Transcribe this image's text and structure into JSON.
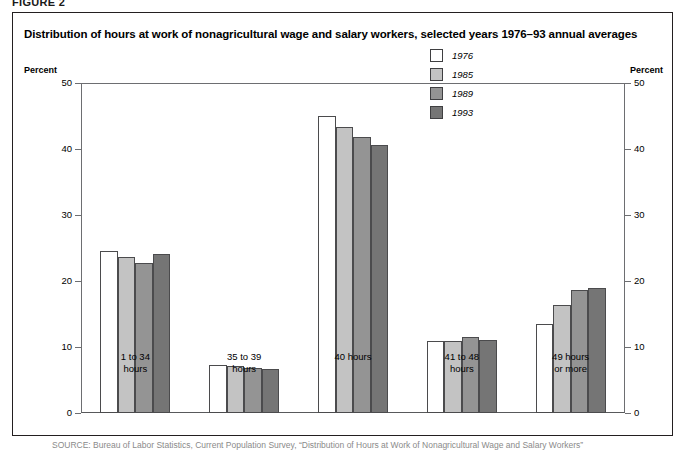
{
  "figure": {
    "number_label": "FIGURE 2",
    "title": "Distribution of hours at work of nonagricultural wage and salary workers, selected years 1976–93 annual averages",
    "source_note": "SOURCE: Bureau of Labor Statistics, Current Population Survey, “Distribution of Hours at Work of Nonagricultural Wage and Salary Workers”"
  },
  "axis": {
    "left_title": "Percent",
    "right_title": "Percent",
    "ticks": [
      "50",
      "40",
      "30",
      "20",
      "10",
      "0"
    ]
  },
  "legend": {
    "items": [
      {
        "label": "1976",
        "color": "#ffffff"
      },
      {
        "label": "1985",
        "color": "#c3c3c3"
      },
      {
        "label": "1989",
        "color": "#949494"
      },
      {
        "label": "1993",
        "color": "#757575"
      }
    ]
  },
  "chart_data": {
    "type": "bar",
    "title": "Distribution of hours at work of nonagricultural wage and salary workers, selected years 1976–93 annual averages",
    "xlabel": "",
    "ylabel": "Percent",
    "ylim": [
      0,
      50
    ],
    "yticks": [
      0,
      10,
      20,
      30,
      40,
      50
    ],
    "grid": false,
    "legend_position": "top-right",
    "categories": [
      "1 to 34\nhours",
      "35 to 39\nhours",
      "40 hours",
      "41 to 48\nhours",
      "49 hours\nor more"
    ],
    "category_lines": [
      [
        "1 to 34",
        "hours"
      ],
      [
        "35 to 39",
        "hours"
      ],
      [
        "40 hours",
        ""
      ],
      [
        "41 to 48",
        "hours"
      ],
      [
        "49 hours",
        "or more"
      ]
    ],
    "series": [
      {
        "name": "1976",
        "color": "#ffffff",
        "values": [
          24.5,
          7.2,
          45.0,
          10.9,
          13.5
        ]
      },
      {
        "name": "1985",
        "color": "#c3c3c3",
        "values": [
          23.7,
          7.1,
          43.3,
          10.9,
          16.3
        ]
      },
      {
        "name": "1989",
        "color": "#949494",
        "values": [
          22.8,
          6.8,
          41.8,
          11.5,
          18.6
        ]
      },
      {
        "name": "1993",
        "color": "#757575",
        "values": [
          24.1,
          6.7,
          40.6,
          11.0,
          19.0
        ]
      }
    ]
  }
}
